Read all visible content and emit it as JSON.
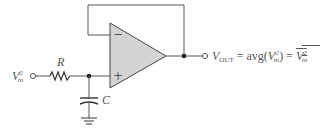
{
  "diagram": {
    "colors": {
      "wire": "#555555",
      "opamp_fill": "#d4d4d4",
      "opamp_stroke": "#444444",
      "text": "#555555"
    },
    "components": {
      "resistor": {
        "label": "R"
      },
      "capacitor": {
        "label": "C"
      },
      "opamp": {
        "inverting_symbol": "−",
        "noninverting_symbol": "+"
      }
    },
    "labels": {
      "input": {
        "base": "V",
        "sup": "2",
        "sub": "in"
      },
      "output": {
        "v": "V",
        "sub": "OUT",
        "eq1": " = avg(",
        "v2": "V",
        "sup2": "2",
        "sub2": "in",
        "eq2": ") = ",
        "v3": "V",
        "sup3": "2",
        "sub3": "in"
      }
    }
  }
}
